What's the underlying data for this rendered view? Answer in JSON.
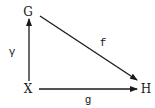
{
  "diagram": {
    "type": "commutative-triangle",
    "nodes": [
      {
        "id": "G",
        "label": "G",
        "x": 28,
        "y": 12
      },
      {
        "id": "X",
        "label": "X",
        "x": 28,
        "y": 89
      },
      {
        "id": "H",
        "label": "H",
        "x": 146,
        "y": 89
      }
    ],
    "edges": [
      {
        "from": "X",
        "to": "G",
        "label": "γ",
        "label_x": 12,
        "label_y": 52
      },
      {
        "from": "G",
        "to": "H",
        "label": "f",
        "label_x": 103,
        "label_y": 43
      },
      {
        "from": "X",
        "to": "H",
        "label": "g",
        "label_x": 88,
        "label_y": 100
      }
    ],
    "colors": {
      "stroke": "#1a1a1a",
      "background": "#ffffff"
    }
  }
}
